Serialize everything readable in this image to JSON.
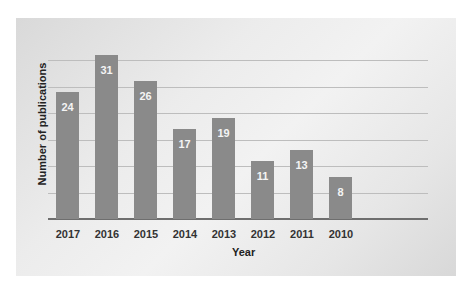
{
  "chart_data": {
    "type": "bar",
    "title": "",
    "xlabel": "Year",
    "ylabel": "Number of publications",
    "categories": [
      "2017",
      "2016",
      "2015",
      "2014",
      "2013",
      "2012",
      "2011",
      "2010"
    ],
    "values": [
      24,
      31,
      26,
      17,
      19,
      11,
      13,
      8
    ],
    "data_labels": [
      "24",
      "31",
      "26",
      "17",
      "19",
      "11",
      "13",
      "8"
    ],
    "ylim": [
      0,
      35
    ],
    "grid": true,
    "legend": null,
    "colors": {
      "bar": "#8a8a8a",
      "label": "#f4f4f4",
      "grid": "#bdbdbd",
      "axis": "#6e6e6e"
    }
  }
}
